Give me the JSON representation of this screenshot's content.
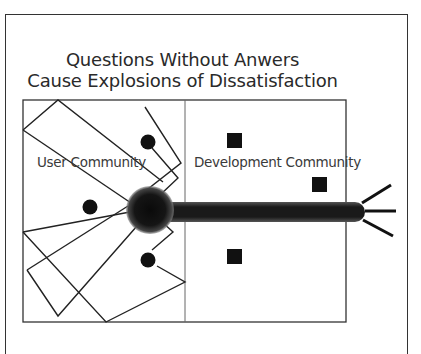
{
  "title": {
    "line1": "Questions Without Anwers",
    "line2": "Cause Explosions of Dissatisfaction"
  },
  "regions": {
    "left_label": "User Community",
    "right_label": "Development Community"
  },
  "colors": {
    "stroke": "#2a2a2a",
    "fill_dark": "#111111",
    "frame": "#333333"
  },
  "elements": {
    "user_dots": 3,
    "developer_squares": 3,
    "explosion_spikes": 3
  }
}
